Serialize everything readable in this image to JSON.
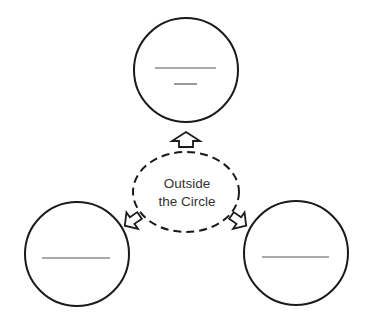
{
  "diagram": {
    "center": {
      "shape": "dashed-ellipse",
      "lines": [
        "Outside",
        "the Circle"
      ]
    },
    "circles": [
      {
        "position": "top",
        "blanks": 2
      },
      {
        "position": "bottom-left",
        "blanks": 1
      },
      {
        "position": "bottom-right",
        "blanks": 1
      }
    ],
    "arrows": [
      {
        "direction": "up",
        "target": "top"
      },
      {
        "direction": "down-left",
        "target": "bottom-left"
      },
      {
        "direction": "down-right",
        "target": "bottom-right"
      }
    ],
    "colors": {
      "stroke": "#1a1a1a",
      "text": "#333333",
      "blank_line": "#555555",
      "background": "#ffffff"
    }
  }
}
